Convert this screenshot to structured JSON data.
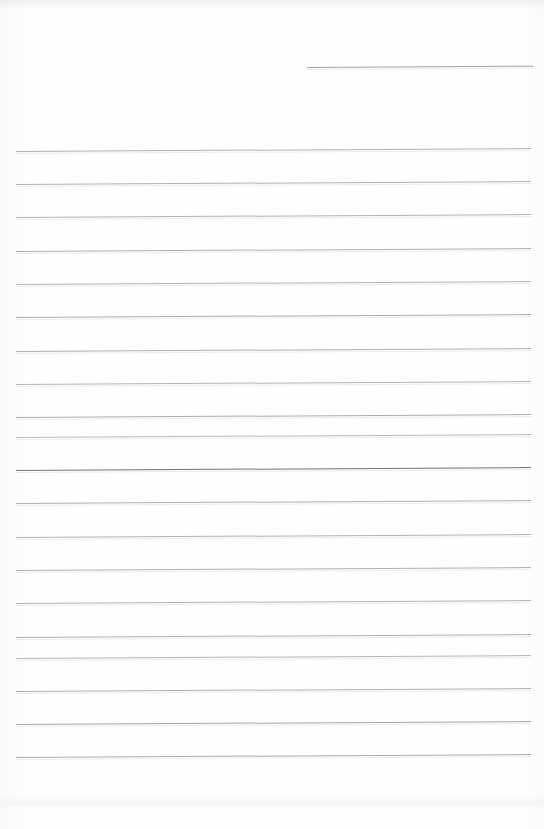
{
  "document": {
    "kind": "scanned-lined-notepad-page",
    "title": "",
    "body_text": "",
    "page_width": 544,
    "page_height": 829,
    "background_color": "#fefefe",
    "note": "Blank ruled writing page — no text content present"
  },
  "ruling": {
    "line_color": "#a9a9ad",
    "emphasis_line_color": "#6e6e73",
    "line_count": 20,
    "line_spacing": 33.3,
    "left_margin": 16,
    "right_margin": 531,
    "skew_degrees": -0.33
  },
  "lines": [
    {
      "index": 1,
      "label": "header-rule",
      "x": 307,
      "y": 67,
      "width": 226,
      "thickness": 1,
      "color": "#9b9b9f",
      "emphasis": false
    },
    {
      "index": 2,
      "label": "rule-1",
      "x": 16,
      "y": 151,
      "width": 515,
      "thickness": 1,
      "color": "#ababaf",
      "emphasis": false
    },
    {
      "index": 3,
      "label": "rule-2",
      "x": 16,
      "y": 184,
      "width": 515,
      "thickness": 1,
      "color": "#ababaf",
      "emphasis": false
    },
    {
      "index": 4,
      "label": "rule-3",
      "x": 16,
      "y": 217,
      "width": 515,
      "thickness": 1,
      "color": "#adadb1",
      "emphasis": false
    },
    {
      "index": 5,
      "label": "rule-4",
      "x": 16,
      "y": 251,
      "width": 515,
      "thickness": 1,
      "color": "#a8a8ac",
      "emphasis": false
    },
    {
      "index": 6,
      "label": "rule-5",
      "x": 16,
      "y": 284,
      "width": 515,
      "thickness": 1,
      "color": "#adadb1",
      "emphasis": false
    },
    {
      "index": 7,
      "label": "rule-6",
      "x": 16,
      "y": 317,
      "width": 515,
      "thickness": 1,
      "color": "#a5a5a9",
      "emphasis": false
    },
    {
      "index": 8,
      "label": "rule-7",
      "x": 16,
      "y": 351,
      "width": 515,
      "thickness": 1,
      "color": "#a9a9ad",
      "emphasis": false
    },
    {
      "index": 9,
      "label": "rule-8",
      "x": 16,
      "y": 384,
      "width": 515,
      "thickness": 1,
      "color": "#aeaeb2",
      "emphasis": false
    },
    {
      "index": 10,
      "label": "rule-9",
      "x": 16,
      "y": 417,
      "width": 515,
      "thickness": 1,
      "color": "#a6a6aa",
      "emphasis": false
    },
    {
      "index": 11,
      "label": "rule-10",
      "x": 16,
      "y": 437,
      "width": 515,
      "thickness": 1,
      "color": "#b4b4b8",
      "emphasis": false
    },
    {
      "index": 12,
      "label": "rule-11-bold",
      "x": 16,
      "y": 470,
      "width": 515,
      "thickness": 1.4,
      "color": "#74747a",
      "emphasis": true
    },
    {
      "index": 13,
      "label": "rule-12",
      "x": 16,
      "y": 503,
      "width": 515,
      "thickness": 1,
      "color": "#a9a9ad",
      "emphasis": false
    },
    {
      "index": 14,
      "label": "rule-13",
      "x": 16,
      "y": 537,
      "width": 515,
      "thickness": 1,
      "color": "#adadb1",
      "emphasis": false
    },
    {
      "index": 15,
      "label": "rule-14",
      "x": 16,
      "y": 570,
      "width": 515,
      "thickness": 1,
      "color": "#a9a9ad",
      "emphasis": false
    },
    {
      "index": 16,
      "label": "rule-15",
      "x": 16,
      "y": 603,
      "width": 515,
      "thickness": 1,
      "color": "#adadb1",
      "emphasis": false
    },
    {
      "index": 17,
      "label": "rule-16",
      "x": 16,
      "y": 637,
      "width": 515,
      "thickness": 1,
      "color": "#a9a9ad",
      "emphasis": false
    },
    {
      "index": 18,
      "label": "rule-17",
      "x": 16,
      "y": 658,
      "width": 515,
      "thickness": 1,
      "color": "#b0b0b4",
      "emphasis": false
    },
    {
      "index": 19,
      "label": "rule-18",
      "x": 16,
      "y": 691,
      "width": 515,
      "thickness": 1,
      "color": "#a9a9ad",
      "emphasis": false
    },
    {
      "index": 20,
      "label": "rule-19",
      "x": 16,
      "y": 724,
      "width": 515,
      "thickness": 1,
      "color": "#9f9fa4",
      "emphasis": false
    },
    {
      "index": 21,
      "label": "rule-20",
      "x": 16,
      "y": 757,
      "width": 515,
      "thickness": 1,
      "color": "#a4a4a9",
      "emphasis": false
    }
  ]
}
